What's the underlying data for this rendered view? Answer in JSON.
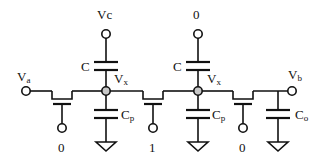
{
  "diagram": {
    "type": "circuit-schematic",
    "terminals": {
      "input": {
        "label": "V",
        "sub": "a"
      },
      "output": {
        "label": "V",
        "sub": "b"
      }
    },
    "nodes": [
      {
        "label": "V",
        "sub": "x",
        "top_terminal": "Vc",
        "coupling_cap": "C",
        "parasitic_cap": {
          "label": "C",
          "sub": "p"
        }
      },
      {
        "label": "V",
        "sub": "x",
        "top_terminal": "0",
        "coupling_cap": "C",
        "parasitic_cap": {
          "label": "C",
          "sub": "p"
        }
      }
    ],
    "transistors": [
      {
        "gate_value": "0"
      },
      {
        "gate_value": "1"
      },
      {
        "gate_value": "0"
      }
    ],
    "output_cap": {
      "label": "C",
      "sub": "o"
    },
    "colors": {
      "wire": "#111111",
      "node_fill": "#c8c8c8"
    }
  }
}
